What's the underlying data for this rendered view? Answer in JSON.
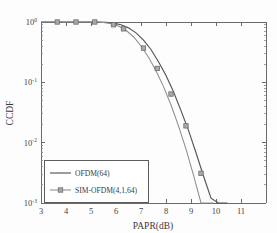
{
  "chart_data": {
    "type": "line",
    "title": "",
    "xlabel": "PAPR(dB)",
    "ylabel": "CCDF",
    "xlim": [
      3,
      12
    ],
    "ylim_log": [
      -3,
      0
    ],
    "xticks": [
      3,
      4,
      5,
      6,
      7,
      8,
      9,
      10,
      11
    ],
    "xtick_labels": [
      "3",
      "4",
      "5",
      "6",
      "7",
      "8",
      "9",
      "10",
      "11"
    ],
    "yticks_log": [
      0,
      -1,
      -2,
      -3
    ],
    "ytick_labels": [
      "10^0",
      "10^-1",
      "10^-2",
      "10^-3"
    ],
    "ytick_base": "10",
    "ytick_exponents": [
      "0",
      "-1",
      "-2",
      "-3"
    ],
    "grid": false,
    "legend_position": "lower-left",
    "series": [
      {
        "name": "OFDM(64)",
        "marker": "none",
        "color": "#555555",
        "x": [
          3.0,
          3.6,
          4.2,
          4.8,
          5.2,
          5.6,
          5.9,
          6.2,
          6.5,
          6.8,
          7.1,
          7.4,
          7.7,
          8.0,
          8.3,
          8.6,
          8.9,
          9.2,
          9.5,
          9.8,
          10.1,
          10.3,
          10.45
        ],
        "y": [
          1.0,
          1.0,
          1.0,
          1.0,
          0.999,
          0.99,
          0.96,
          0.9,
          0.8,
          0.66,
          0.5,
          0.35,
          0.22,
          0.13,
          0.07,
          0.034,
          0.016,
          0.0068,
          0.0028,
          0.0012,
          0.0005,
          0.00018,
          0.0001
        ]
      },
      {
        "name": "SIM-OFDM(4,1,64)",
        "marker": "square",
        "color": "#8d8d8d",
        "x": [
          3.0,
          3.6,
          4.2,
          4.8,
          5.2,
          5.5,
          5.8,
          6.1,
          6.4,
          6.7,
          7.0,
          7.3,
          7.6,
          7.9,
          8.2,
          8.5,
          8.8,
          9.1,
          9.4,
          9.6,
          9.8,
          9.9
        ],
        "y": [
          1.0,
          1.0,
          1.0,
          1.0,
          0.998,
          0.985,
          0.94,
          0.86,
          0.73,
          0.57,
          0.4,
          0.26,
          0.155,
          0.085,
          0.042,
          0.019,
          0.0078,
          0.0029,
          0.001,
          0.0004,
          0.00013,
          0.0001
        ],
        "marker_x": [
          3.65,
          4.4,
          5.15,
          5.9,
          6.3,
          7.1,
          7.65,
          8.2,
          8.8,
          9.4
        ],
        "marker_y": [
          1.0,
          1.0,
          1.0,
          0.9,
          0.77,
          0.37,
          0.17,
          0.064,
          0.019,
          0.0031
        ]
      }
    ],
    "legend_entries": [
      {
        "label": "OFDM(64)",
        "marker": "none",
        "color": "#555555"
      },
      {
        "label": "SIM-OFDM(4,1,64)",
        "marker": "square",
        "color": "#8d8d8d"
      }
    ]
  }
}
